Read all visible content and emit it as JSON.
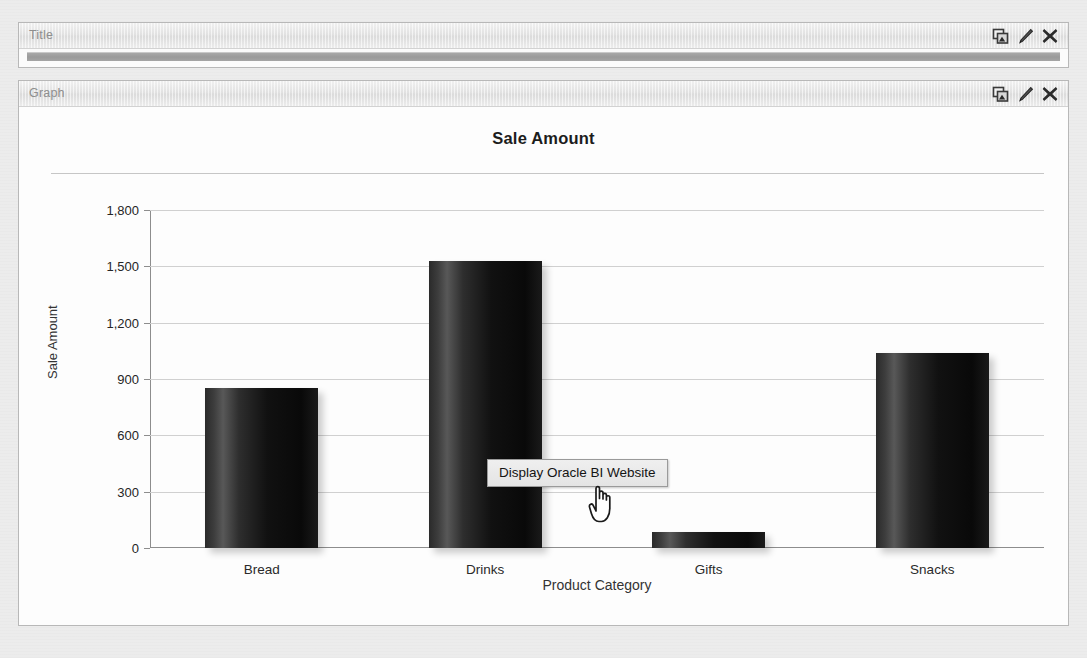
{
  "panels": [
    {
      "id": "title",
      "header_label": "Title",
      "icons": [
        {
          "name": "copy-icon",
          "glyph": "copy"
        },
        {
          "name": "edit-pencil-icon",
          "glyph": "pencil"
        },
        {
          "name": "close-icon",
          "glyph": "x"
        }
      ]
    },
    {
      "id": "graph",
      "header_label": "Graph",
      "icons": [
        {
          "name": "copy-icon",
          "glyph": "copy"
        },
        {
          "name": "edit-pencil-icon",
          "glyph": "pencil"
        },
        {
          "name": "close-icon",
          "glyph": "x"
        }
      ]
    }
  ],
  "tooltip": {
    "text": "Display Oracle BI Website"
  },
  "cursor": {
    "type": "pointing-hand"
  },
  "colors": {
    "bar_dark": "#0b0b0b",
    "bar_highlight": "#585858",
    "gridline": "#d0d0d0",
    "axis": "#8d8d8d",
    "panel_border": "#b8b8b8",
    "header_text": "#8e8e8e"
  },
  "chart_data": {
    "type": "bar",
    "title": "Sale Amount",
    "xlabel": "Product Category",
    "ylabel": "Sale Amount",
    "categories": [
      "Bread",
      "Drinks",
      "Gifts",
      "Snacks"
    ],
    "values": [
      850,
      1530,
      85,
      1040
    ],
    "ylim": [
      0,
      1800
    ],
    "yticks": [
      0,
      300,
      600,
      900,
      1200,
      1500,
      1800
    ],
    "ytick_labels": [
      "0",
      "300",
      "600",
      "900",
      "1,200",
      "1,500",
      "1,800"
    ],
    "grid": true,
    "legend": false
  }
}
